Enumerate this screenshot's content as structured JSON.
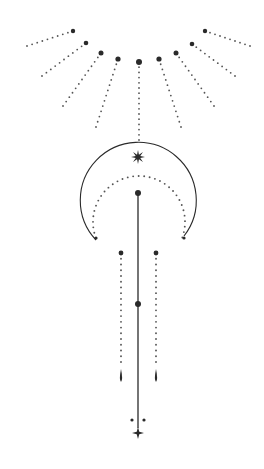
{
  "artwork": {
    "title": "Celestial crescent moon line art",
    "width": 264,
    "height": 469,
    "colors": {
      "background": "#ffffff",
      "ink": "#2a2a2a",
      "dots": "#555555"
    },
    "sun_rays": {
      "big_dots": [
        [
          73,
          31
        ],
        [
          86,
          43
        ],
        [
          101,
          53
        ],
        [
          118,
          59
        ],
        [
          139,
          62
        ],
        [
          159,
          59
        ],
        [
          176,
          53
        ],
        [
          192,
          44
        ],
        [
          205,
          31
        ]
      ],
      "dot_radii": [
        2.2,
        2.3,
        2.5,
        2.6,
        3.0,
        2.6,
        2.5,
        2.3,
        2.2
      ],
      "ray_ends": [
        [
          27,
          46
        ],
        [
          42,
          76
        ],
        [
          63,
          106
        ],
        [
          96,
          127
        ],
        [
          139,
          140
        ],
        [
          181,
          127
        ],
        [
          214,
          106
        ],
        [
          235,
          76
        ],
        [
          250,
          46
        ]
      ]
    },
    "moon": {
      "outer_arc": {
        "cx": 139,
        "cy": 197,
        "r": 58,
        "start": [
          96,
          240
        ],
        "end": [
          184,
          236
        ]
      },
      "inner_dotted_arc": {
        "cx": 139,
        "cy": 222,
        "r": 46,
        "start": [
          96,
          238
        ],
        "end": [
          184,
          238
        ]
      },
      "star": {
        "cx": 138,
        "cy": 157,
        "r": 7,
        "points": 8
      }
    },
    "center_line": {
      "x": 138,
      "top": 193,
      "bottom": 428,
      "top_dot_r": 3,
      "mid_dot": [
        138,
        304
      ],
      "mid_dot_r": 3
    },
    "side_drops": [
      {
        "x": 121,
        "top_dot": 253,
        "dots_end": 362,
        "drop_top": 369,
        "drop_bottom": 382
      },
      {
        "x": 156,
        "top_dot": 253,
        "dots_end": 362,
        "drop_top": 369,
        "drop_bottom": 382
      }
    ],
    "bottom": {
      "small_dots": [
        [
          132,
          420
        ],
        [
          144,
          420
        ]
      ],
      "star": {
        "cx": 138,
        "cy": 433,
        "r": 6
      }
    }
  }
}
